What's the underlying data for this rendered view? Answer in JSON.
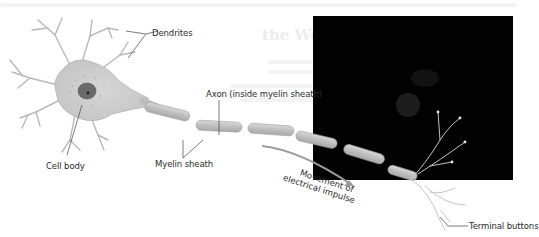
{
  "diagram": {
    "labels": {
      "dendrites": "Dendrites",
      "cell_body": "Cell body",
      "axon": "Axon (inside myelin sheath)",
      "myelin_sheath": "Myelin sheath",
      "impulse_line1": "Movement of",
      "impulse_line2": "electrical impulse",
      "terminal_buttons": "Terminal buttons"
    },
    "colors": {
      "neuron_fill": "#c9c9c9",
      "neuron_stroke": "#a8a8a8",
      "nucleus": "#5e5e5e",
      "myelin": "#bdbdbd",
      "arrow": "#9a9a9a",
      "overlay_panel": "#020202",
      "label_text": "#2a2a2a"
    }
  },
  "background_page": {
    "heading_fragment": "the Web"
  }
}
